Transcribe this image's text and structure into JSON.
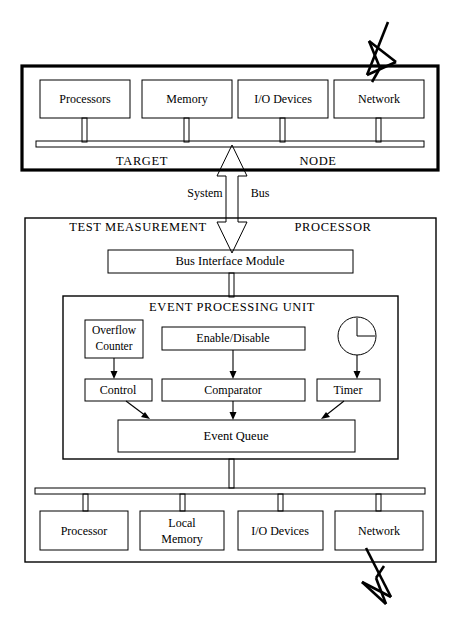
{
  "figure": {
    "colors": {
      "ink": "#000000",
      "paper": "#ffffff"
    }
  },
  "target_node": {
    "label_left": "TARGET",
    "label_right": "NODE",
    "components": [
      {
        "label": "Processors"
      },
      {
        "label": "Memory"
      },
      {
        "label": "I/O Devices"
      },
      {
        "label": "Network"
      }
    ],
    "bus_name": "internal bus bar"
  },
  "interconnect": {
    "label_left": "System",
    "label_right": "Bus",
    "arrow": "double-headed vertical arrow"
  },
  "tmp": {
    "label_left": "TEST MEASUREMENT",
    "label_right": "PROCESSOR",
    "bus_interface": {
      "label": "Bus Interface Module"
    },
    "epu": {
      "title": "EVENT PROCESSING UNIT",
      "blocks": [
        {
          "label": "Overflow\nCounter",
          "line1": "Overflow",
          "line2": "Counter"
        },
        {
          "label": "Enable/Disable"
        },
        {
          "label": "Control"
        },
        {
          "label": "Comparator"
        },
        {
          "label": "Timer"
        },
        {
          "label": "Event Queue"
        }
      ],
      "clock_icon": "clock-icon"
    },
    "components": [
      {
        "label": "Processor"
      },
      {
        "label": "Local\nMemory",
        "line1": "Local",
        "line2": "Memory"
      },
      {
        "label": "I/O Devices"
      },
      {
        "label": "Network"
      }
    ]
  },
  "annotations": {
    "top_bolt": "lightning-bolt-connector-top",
    "bottom_bolt": "lightning-bolt-connector-bottom"
  }
}
